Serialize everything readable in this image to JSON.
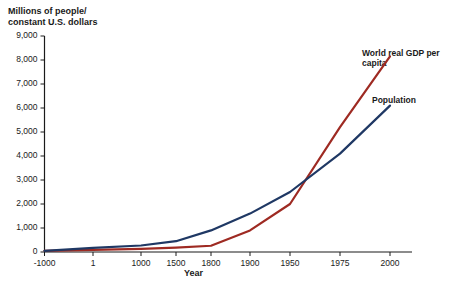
{
  "chart_data": {
    "type": "line",
    "title": "",
    "ylabel": "Millions of people/\nconstant U.S. dollars",
    "xlabel": "Year",
    "ylim": [
      0,
      9000
    ],
    "yticks": [
      0,
      1000,
      2000,
      3000,
      4000,
      5000,
      6000,
      7000,
      8000,
      9000
    ],
    "ytick_labels": [
      "0",
      "1,000",
      "2,000",
      "3,000",
      "4,000",
      "5,000",
      "6,000",
      "7,000",
      "8,000",
      "9,000"
    ],
    "xticks": [
      -1000,
      1,
      1000,
      1500,
      1800,
      1900,
      1950,
      1975,
      2000
    ],
    "xtick_labels": [
      "-1000",
      "1",
      "1000",
      "1500",
      "1800",
      "1900",
      "1950",
      "1975",
      "2000"
    ],
    "grid": false,
    "legend_position": "inline-right",
    "series": [
      {
        "name": "World real GDP per capita",
        "color": "#9e2a22",
        "x": [
          -1000,
          1,
          1000,
          1500,
          1800,
          1900,
          1950,
          1975,
          2000
        ],
        "values": [
          50,
          90,
          130,
          180,
          260,
          900,
          2000,
          5200,
          8150
        ]
      },
      {
        "name": "Population",
        "color": "#1f3864",
        "x": [
          -1000,
          1,
          1000,
          1500,
          1800,
          1900,
          1950,
          1975,
          2000
        ],
        "values": [
          50,
          170,
          270,
          450,
          900,
          1600,
          2500,
          4100,
          6100
        ]
      }
    ]
  },
  "axes": {
    "y_title": "Millions of people/\nconstant U.S. dollars",
    "x_title": "Year"
  },
  "labels": {
    "gdp": "World real GDP per\ncapita",
    "population": "Population"
  },
  "colors": {
    "gdp_line": "#9e2a22",
    "population_line": "#1f3864",
    "axis": "#1a1a1a",
    "background": "#ffffff"
  }
}
